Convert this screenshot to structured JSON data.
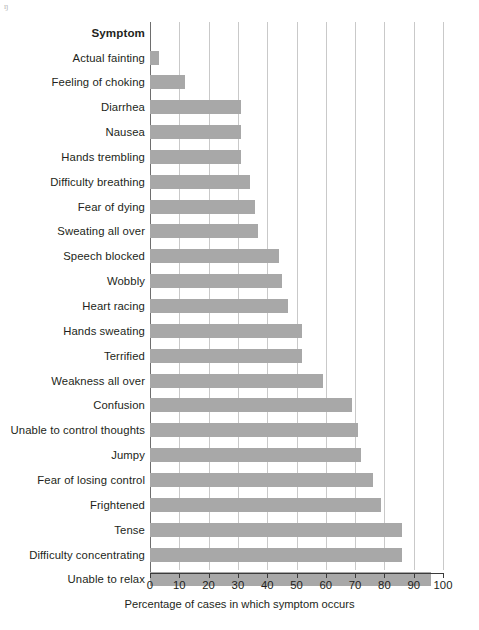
{
  "chart_data": {
    "type": "bar",
    "orientation": "horizontal",
    "title": "",
    "xlabel": "Percentage of cases in which symptom occurs",
    "ylabel": "Symptom",
    "category_header": "Symptom",
    "xlim": [
      0,
      100
    ],
    "xticks": [
      0,
      10,
      20,
      30,
      40,
      50,
      60,
      70,
      80,
      90,
      100
    ],
    "xtick_labels": [
      "0",
      "10",
      "20",
      "30",
      "40",
      "50",
      "60",
      "70",
      "80",
      "90",
      "100"
    ],
    "grid": "vertical",
    "legend": "none",
    "bar_color": "#a8a8a8",
    "gridline_color": "#c9c9c9",
    "axis_color": "#3b3b3b",
    "categories": [
      "Actual fainting",
      "Feeling of choking",
      "Diarrhea",
      "Nausea",
      "Hands trembling",
      "Difficulty breathing",
      "Fear of dying",
      "Sweating all over",
      "Speech blocked",
      "Wobbly",
      "Heart racing",
      "Hands sweating",
      "Terrified",
      "Weakness all over",
      "Confusion",
      "Unable to control thoughts",
      "Jumpy",
      "Fear of losing control",
      "Frightened",
      "Tense",
      "Difficulty concentrating",
      "Unable to relax"
    ],
    "values": [
      3,
      12,
      31,
      31,
      31,
      34,
      36,
      37,
      44,
      45,
      47,
      52,
      52,
      59,
      69,
      71,
      72,
      76,
      79,
      86,
      86,
      96
    ]
  },
  "corner_mark": "ŋ"
}
